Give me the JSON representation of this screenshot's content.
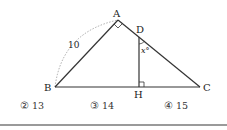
{
  "figure": {
    "points": {
      "A": {
        "label": "A",
        "x": 118,
        "y": 20
      },
      "B": {
        "label": "B",
        "x": 55,
        "y": 87
      },
      "C": {
        "label": "C",
        "x": 200,
        "y": 87
      },
      "D": {
        "label": "D",
        "x": 139,
        "y": 35
      },
      "H": {
        "label": "H",
        "x": 139,
        "y": 87
      }
    },
    "side_label_AB": "10",
    "angle_label": "x°",
    "right_angles": [
      "A",
      "H"
    ]
  },
  "options": [
    {
      "marker": "②",
      "value": "13"
    },
    {
      "marker": "③",
      "value": "14"
    },
    {
      "marker": "④",
      "value": "15"
    }
  ]
}
